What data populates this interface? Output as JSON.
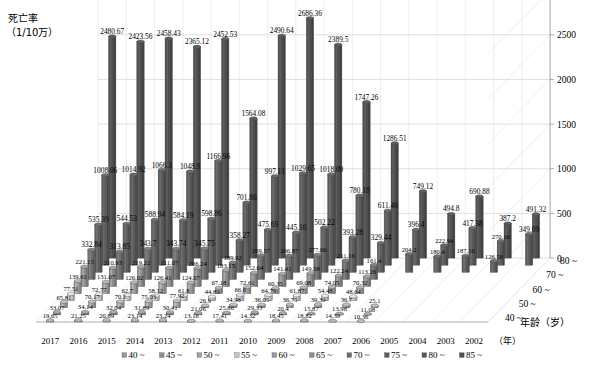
{
  "chart_data": {
    "type": "bar",
    "title": "",
    "subtitle": "",
    "ylabel_line1": "死亡率",
    "ylabel_line2": "（1/10万）",
    "xlabel": "（年）",
    "zlabel": "年龄（岁）",
    "ylim": [
      0,
      3000
    ],
    "yticks": [
      "0",
      "500",
      "1000",
      "1500",
      "2000",
      "2500",
      "3000"
    ],
    "ytick_values": [
      0,
      500,
      1000,
      1500,
      2000,
      2500,
      3000
    ],
    "grid": true,
    "legend_position": "bottom",
    "projection": "3d-grouped-columns",
    "categories": [
      "2017",
      "2016",
      "2015",
      "2014",
      "2013",
      "2012",
      "2011",
      "2010",
      "2009",
      "2008",
      "2007",
      "2006",
      "2005",
      "2004",
      "2003",
      "2002"
    ],
    "depth_axis_ticks": [
      "40 ~",
      "50 ~",
      "60 ~",
      "70 ~",
      "80 ~"
    ],
    "legend": [
      "40 ~",
      "45 ~",
      "50 ~",
      "55 ~",
      "60 ~",
      "65 ~",
      "70 ~",
      "75 ~",
      "80 ~",
      "85 ~"
    ],
    "series": [
      {
        "name": "40 ~",
        "values": [
          19.65,
          21.25,
          20.89,
          23.14,
          23.24,
          13.16,
          17.41,
          14.32,
          18.45,
          18.82,
          14.39,
          10.36,
          null,
          null,
          null,
          null
        ]
      },
      {
        "name": "45 ~",
        "values": [
          33.07,
          34.14,
          32.04,
          31.89,
          30.41,
          21.06,
          25.86,
          29.33,
          20.4,
          15.87,
          13.98,
          11.08,
          null,
          null,
          null,
          null
        ]
      },
      {
        "name": "50 ~",
        "values": [
          65.81,
          70.17,
          70.1,
          75.03,
          77.92,
          26.9,
          34.98,
          36.05,
          36.75,
          39.39,
          36.7,
          25.1,
          null,
          null,
          null,
          null
        ]
      },
      {
        "name": "55 ~",
        "values": [
          77.51,
          72.77,
          62.7,
          58.12,
          61.8,
          44.89,
          66.6,
          64.79,
          61.87,
          54.48,
          48.64,
          null,
          null,
          null,
          null,
          null
        ]
      },
      {
        "name": "60 ~",
        "values": [
          139.61,
          131.07,
          126.02,
          126.41,
          124.07,
          67.18,
          72.61,
          60.35,
          69.08,
          74.05,
          70.32,
          null,
          null,
          null,
          null,
          null
        ]
      },
      {
        "name": "65 ~",
        "values": [
          221.15,
          210.93,
          219.22,
          211.07,
          206.24,
          183.15,
          152.64,
          141.41,
          149.38,
          122.24,
          113.26,
          null,
          null,
          null,
          null,
          null
        ]
      },
      {
        "name": "70 ~",
        "values": [
          332.84,
          313.85,
          343.7,
          343.74,
          345.75,
          189.92,
          269.57,
          266.87,
          277.06,
          211.16,
          161.4,
          null,
          null,
          null,
          null,
          null
        ]
      },
      {
        "name": "75 ~",
        "values": [
          535.39,
          544.53,
          588.94,
          584.19,
          598.86,
          358.27,
          475.69,
          445.16,
          502.22,
          393.28,
          329.44,
          204.2,
          180.4,
          187.16,
          126.58,
          null
        ]
      },
      {
        "name": "80 ~",
        "values": [
          1008.06,
          1014.92,
          1066.3,
          1048.9,
          1166.96,
          701.86,
          997.11,
          1029.65,
          1018.09,
          780.18,
          611.46,
          396.4,
          222.94,
          417.38,
          270.16,
          349.09
        ]
      },
      {
        "name": "85 ~",
        "values": [
          2480.67,
          2423.56,
          2458.43,
          2365.12,
          2452.53,
          1564.08,
          2490.64,
          2686.36,
          2389.5,
          1747.26,
          1286.51,
          749.12,
          494.8,
          690.88,
          387.2,
          491.32
        ]
      }
    ],
    "series_colors": [
      "#9b9b9b",
      "#8e8e8e",
      "#a2a2a2",
      "#c4c4c4",
      "#9a9a9a",
      "#8c8c8c",
      "#6d6d6d",
      "#5e5e5e",
      "#5a5a5a",
      "#4f4f4f"
    ],
    "annotations": {
      "note": "数据标签显示于每个柱形顶端"
    }
  }
}
